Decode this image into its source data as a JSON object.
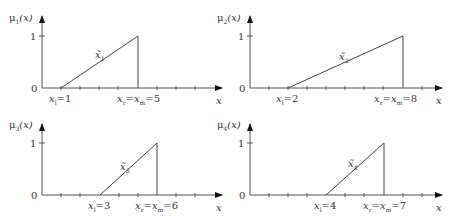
{
  "panels": [
    {
      "ylabel": "μ",
      "ysub": "1",
      "yarg": "(x)",
      "xlabel": "x",
      "y0": "0",
      "y1": "1",
      "curve_label": "x̃",
      "curve_sub": "1",
      "left_label": "x",
      "left_sub": "l",
      "left_val": "=1",
      "right_label": "x",
      "right_sub_a": "r",
      "right_label_b": "=x",
      "right_sub_b": "m",
      "right_val": "=5",
      "left_x": 1,
      "right_x": 5
    },
    {
      "ylabel": "μ",
      "ysub": "2",
      "yarg": "(x)",
      "xlabel": "x",
      "y0": "0",
      "y1": "1",
      "curve_label": "x̃",
      "curve_sub": "2",
      "left_label": "x",
      "left_sub": "l",
      "left_val": "=2",
      "right_label": "x",
      "right_sub_a": "r",
      "right_label_b": "=x",
      "right_sub_b": "m",
      "right_val": "=8",
      "left_x": 2,
      "right_x": 8
    },
    {
      "ylabel": "μ",
      "ysub": "3",
      "yarg": "(x)",
      "xlabel": "x",
      "y0": "0",
      "y1": "1",
      "curve_label": "x̃",
      "curve_sub": "3",
      "left_label": "x",
      "left_sub": "l",
      "left_val": "=3",
      "right_label": "x",
      "right_sub_a": "r",
      "right_label_b": "=x",
      "right_sub_b": "m",
      "right_val": "=6",
      "left_x": 3,
      "right_x": 6
    },
    {
      "ylabel": "μ",
      "ysub": "4",
      "yarg": "(x)",
      "xlabel": "x",
      "y0": "0",
      "y1": "1",
      "curve_label": "x̃",
      "curve_sub": "4",
      "left_label": "x",
      "left_sub": "l",
      "left_val": "=4",
      "right_label": "x",
      "right_sub_a": "r",
      "right_label_b": "=x",
      "right_sub_b": "m",
      "right_val": "=7",
      "left_x": 4,
      "right_x": 7
    }
  ]
}
